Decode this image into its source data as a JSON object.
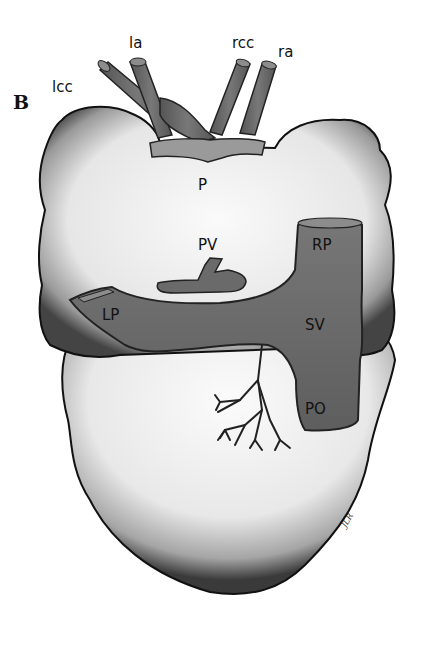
{
  "figure": {
    "panel_label": "B",
    "signature": "JLR",
    "colors": {
      "background": "#ffffff",
      "tissue_fill": "#f7f7f7",
      "tissue_outline": "#111111",
      "vessel_fill": "#6e6e6e",
      "vessel_dark": "#4a4a4a",
      "vessel_light": "#9a9a9a",
      "label": "#111111"
    },
    "labels": {
      "lcc": "lcc",
      "la": "la",
      "rcc": "rcc",
      "ra": "ra",
      "p": "P",
      "pv": "PV",
      "rp": "RP",
      "lp": "LP",
      "sv": "SV",
      "po": "PO"
    }
  }
}
